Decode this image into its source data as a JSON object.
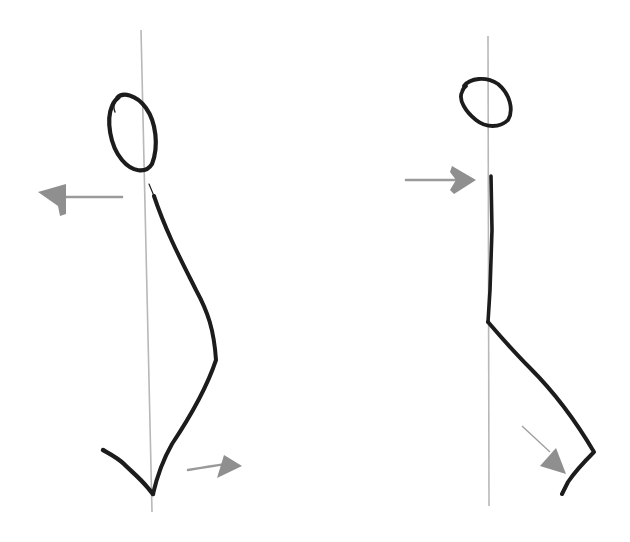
{
  "figure": {
    "description": "Two stick-figure posture sketches with vertical plumb lines and force arrows",
    "colors": {
      "background": "#ffffff",
      "ink": "#1c1c1c",
      "plumb_line": "#b8b8b8",
      "arrow": "#8f8f8f"
    },
    "figures": [
      {
        "id": "left",
        "label": "Leaning figure with arched body",
        "plumb_line_x": 142,
        "arrows": [
          {
            "name": "upper-arrow",
            "direction": "left"
          },
          {
            "name": "lower-arrow",
            "direction": "right"
          }
        ]
      },
      {
        "id": "right",
        "label": "Upright figure with bent leg",
        "plumb_line_x": 488,
        "arrows": [
          {
            "name": "upper-arrow",
            "direction": "right"
          },
          {
            "name": "lower-arrow",
            "direction": "down-right"
          }
        ]
      }
    ]
  }
}
